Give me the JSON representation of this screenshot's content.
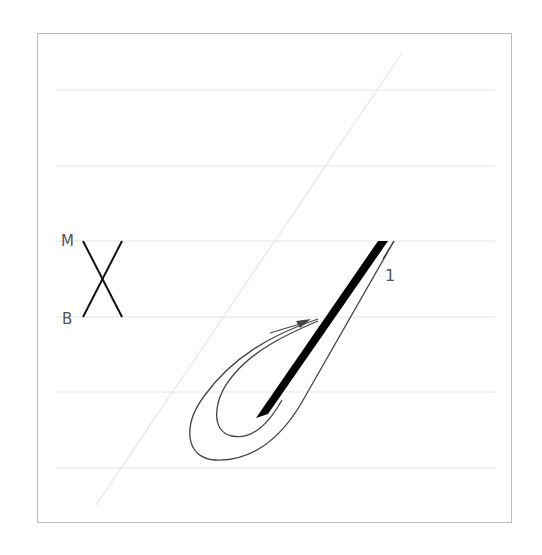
{
  "diagram": {
    "stroke_number": "1",
    "legend": {
      "top_label": "M",
      "bottom_label": "B"
    },
    "colors": {
      "frame": "#bdbdbd",
      "guideline": "#e2e2e2",
      "slant": "#dcdcdc",
      "stroke": "#000000",
      "outline": "#444444",
      "label": "#555555"
    },
    "guidelines_y": [
      90,
      166,
      241,
      317,
      392,
      468
    ]
  }
}
